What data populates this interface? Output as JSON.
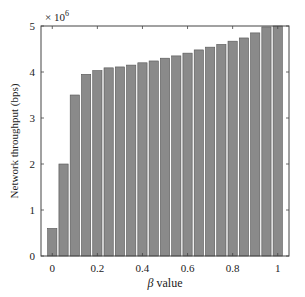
{
  "chart_data": {
    "type": "bar",
    "title": "",
    "xlabel": "β value",
    "xlabel_symbol": "β",
    "xlabel_rest": " value",
    "ylabel": "Network throughput (bps)",
    "y_multiplier_label": "× 10",
    "y_multiplier_exp": "6",
    "xlim": [
      -0.05,
      1.05
    ],
    "ylim": [
      0,
      5000000
    ],
    "x_ticks": [
      0,
      0.2,
      0.4,
      0.6,
      0.8,
      1
    ],
    "x_tick_labels": [
      "0",
      "0.2",
      "0.4",
      "0.6",
      "0.8",
      "1"
    ],
    "y_ticks": [
      0,
      1,
      2,
      3,
      4,
      5
    ],
    "y_tick_labels": [
      "0",
      "1",
      "2",
      "3",
      "4",
      "5"
    ],
    "grid": false,
    "legend": null,
    "bar_color": "#8a8a8a",
    "bar_edge_color": "#555555",
    "categories": [
      0,
      0.05,
      0.1,
      0.15,
      0.2,
      0.25,
      0.3,
      0.35,
      0.4,
      0.45,
      0.5,
      0.55,
      0.6,
      0.65,
      0.7,
      0.75,
      0.8,
      0.85,
      0.9,
      0.95,
      1.0
    ],
    "values": [
      600000,
      2000000,
      3500000,
      3950000,
      4030000,
      4090000,
      4110000,
      4150000,
      4200000,
      4240000,
      4300000,
      4350000,
      4410000,
      4480000,
      4540000,
      4600000,
      4670000,
      4740000,
      4850000,
      4980000,
      5000000
    ]
  }
}
